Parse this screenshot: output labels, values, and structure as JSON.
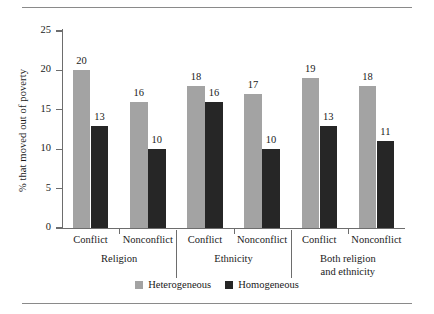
{
  "chart_data": {
    "type": "bar",
    "title": "",
    "xlabel": "",
    "ylabel": "% that moved out of poverty",
    "ylim": [
      0,
      25
    ],
    "yticks": [
      0,
      5,
      10,
      15,
      20,
      25
    ],
    "grid": false,
    "legend_position": "bottom-center",
    "categories": [
      "Conflict",
      "Nonconflict",
      "Conflict",
      "Nonconflict",
      "Conflict",
      "Nonconflict"
    ],
    "groups": [
      {
        "label": "Religion",
        "label_line1": "Religion",
        "label_line2": ""
      },
      {
        "label": "Ethnicity",
        "label_line1": "Ethnicity",
        "label_line2": ""
      },
      {
        "label": "Both religion and ethnicity",
        "label_line1": "Both religion",
        "label_line2": "and ethnicity"
      }
    ],
    "series": [
      {
        "name": "Heterogeneous",
        "color": "#a3a3a3",
        "values": [
          20,
          16,
          18,
          17,
          19,
          18
        ]
      },
      {
        "name": "Homogeneous",
        "color": "#262626",
        "values": [
          13,
          10,
          16,
          10,
          13,
          11
        ]
      }
    ]
  },
  "legend": {
    "items": [
      {
        "label": "Heterogeneous",
        "color": "#a3a3a3"
      },
      {
        "label": "Homogeneous",
        "color": "#262626"
      }
    ]
  }
}
